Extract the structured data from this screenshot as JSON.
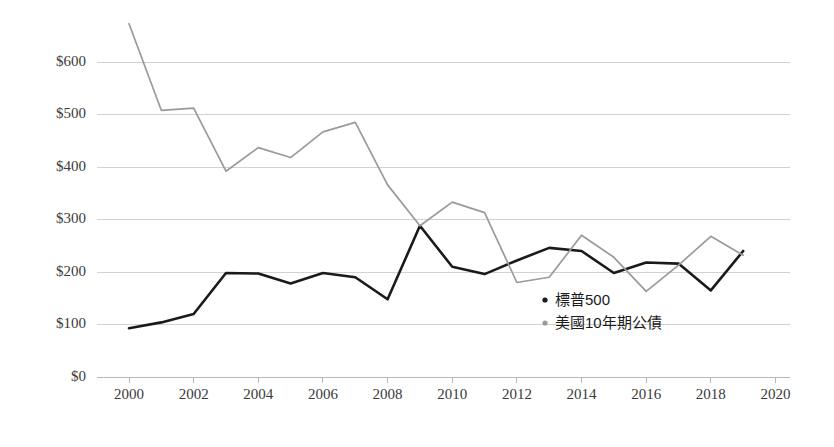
{
  "chart_data": {
    "type": "line",
    "title": "",
    "subtitle": "",
    "xlabel": "",
    "ylabel": "",
    "xlim": [
      2000,
      2020
    ],
    "ylim": [
      0,
      600
    ],
    "grid": true,
    "legend_position": "inside-lower-center",
    "x": [
      2000,
      2001,
      2002,
      2003,
      2004,
      2005,
      2006,
      2007,
      2008,
      2009,
      2010,
      2011,
      2012,
      2013,
      2014,
      2015,
      2016,
      2017,
      2018,
      2019
    ],
    "xtick_labels": [
      "2000",
      "2002",
      "2004",
      "2006",
      "2008",
      "2010",
      "2012",
      "2014",
      "2016",
      "2018",
      "2020"
    ],
    "xtick_values": [
      2000,
      2002,
      2004,
      2006,
      2008,
      2010,
      2012,
      2014,
      2016,
      2018,
      2020
    ],
    "ytick_labels": [
      "$0",
      "$100",
      "$200",
      "$300",
      "$400",
      "$500",
      "$600"
    ],
    "ytick_values": [
      0,
      100,
      200,
      300,
      400,
      500,
      600
    ],
    "series": [
      {
        "name": "標普500",
        "color": "#1a1a1a",
        "marker": "dot",
        "values": [
          93,
          104,
          120,
          198,
          197,
          178,
          198,
          190,
          148,
          288,
          210,
          196,
          222,
          246,
          240,
          198,
          218,
          216,
          165,
          240
        ]
      },
      {
        "name": "美國10年期公債",
        "color": "#9a9a9a",
        "marker": "dot",
        "values": [
          673,
          508,
          512,
          392,
          437,
          418,
          467,
          485,
          366,
          288,
          333,
          313,
          180,
          190,
          270,
          228,
          163,
          213,
          268,
          232
        ]
      }
    ]
  },
  "legend": {
    "items": [
      {
        "label": "標普500",
        "color": "#1a1a1a"
      },
      {
        "label": "美國10年期公債",
        "color": "#9a9a9a"
      }
    ]
  },
  "axis": {
    "y_title": "",
    "x_title": ""
  }
}
